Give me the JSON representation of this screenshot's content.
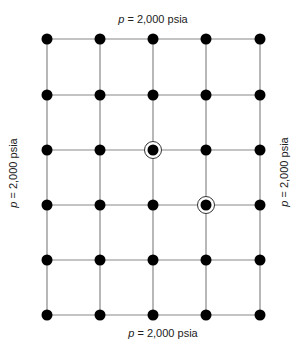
{
  "diagram": {
    "title": "",
    "grid": {
      "columns": 5,
      "rows": 6,
      "x_positions": [
        47,
        100,
        153,
        206,
        260
      ],
      "y_positions": [
        39,
        95,
        150,
        205,
        260,
        315
      ],
      "line_color": "#888888",
      "node_color": "#000000",
      "node_radius": 5.5
    },
    "wells": [
      {
        "col": 3,
        "row": 3,
        "x": 153,
        "y": 150,
        "ring_radius": 8.5
      },
      {
        "col": 4,
        "row": 4,
        "x": 206,
        "y": 205,
        "ring_radius": 8.5
      }
    ],
    "boundary_labels": {
      "top": {
        "var": "p",
        "text": " = 2,000 psia"
      },
      "bottom": {
        "var": "p",
        "text": " = 2,000 psia"
      },
      "left": {
        "var": "p",
        "text": " = 2,000 psia"
      },
      "right": {
        "var": "p",
        "text": " = 2,000 psia"
      }
    }
  }
}
